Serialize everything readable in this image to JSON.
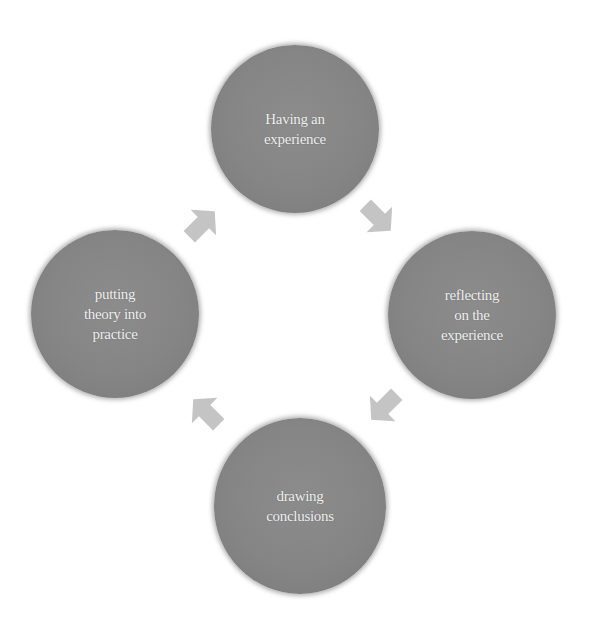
{
  "diagram": {
    "type": "cycle",
    "colors": {
      "node_fill": "#858585",
      "node_text": "#f2f2f2",
      "arrow_fill": "#c4c4c4",
      "background": "#ffffff"
    },
    "nodes": [
      {
        "id": "top",
        "lines": [
          "Having an",
          "experience"
        ]
      },
      {
        "id": "right",
        "lines": [
          "reflecting",
          "on the",
          "experience"
        ]
      },
      {
        "id": "bottom",
        "lines": [
          "drawing",
          "conclusions"
        ]
      },
      {
        "id": "left",
        "lines": [
          "putting",
          "theory into",
          "practice"
        ]
      }
    ],
    "arrows": [
      {
        "from": "top",
        "to": "right",
        "icon": "arrow-down-right-icon"
      },
      {
        "from": "right",
        "to": "bottom",
        "icon": "arrow-down-left-icon"
      },
      {
        "from": "bottom",
        "to": "left",
        "icon": "arrow-up-left-icon"
      },
      {
        "from": "left",
        "to": "top",
        "icon": "arrow-up-right-icon"
      }
    ]
  }
}
